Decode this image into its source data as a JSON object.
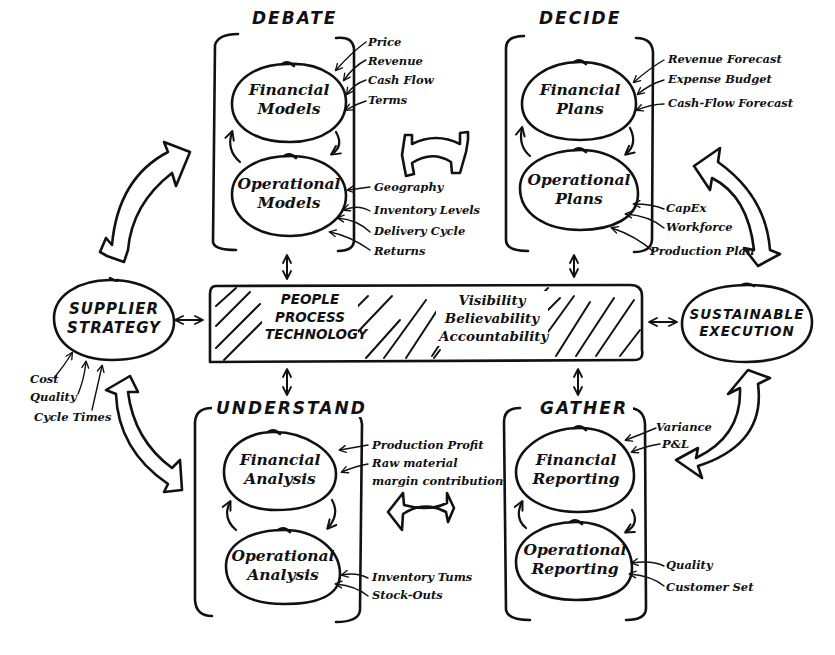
{
  "diagram": {
    "phases": {
      "debate": {
        "title": "DEBATE",
        "top_node": "Financial\nModels",
        "top_node_lines": [
          "Financial",
          "Models"
        ],
        "bottom_node_lines": [
          "Operational",
          "Models"
        ],
        "top_inputs": [
          "Price",
          "Revenue",
          "Cash Flow",
          "Terms"
        ],
        "bottom_inputs": [
          "Geography",
          "Inventory Levels",
          "Delivery Cycle",
          "Returns"
        ]
      },
      "decide": {
        "title": "DECIDE",
        "top_node_lines": [
          "Financial",
          "Plans"
        ],
        "bottom_node_lines": [
          "Operational",
          "Plans"
        ],
        "top_inputs": [
          "Revenue Forecast",
          "Expense Budget",
          "Cash-Flow Forecast"
        ],
        "bottom_inputs": [
          "CapEx",
          "Workforce",
          "Production Plan"
        ]
      },
      "understand": {
        "title": "UNDERSTAND",
        "top_node_lines": [
          "Financial",
          "Analysis"
        ],
        "bottom_node_lines": [
          "Operational",
          "Analysis"
        ],
        "top_inputs": [
          "Production Profit",
          "Raw material",
          "margin contribution"
        ],
        "bottom_inputs": [
          "Inventory Tums",
          "Stock-Outs"
        ]
      },
      "gather": {
        "title": "GATHER",
        "top_node_lines": [
          "Financial",
          "Reporting"
        ],
        "bottom_node_lines": [
          "Operational",
          "Reporting"
        ],
        "top_inputs": [
          "Variance",
          "P&L"
        ],
        "bottom_inputs": [
          "Quality",
          "Customer Set"
        ]
      }
    },
    "supplier_strategy": {
      "lines": [
        "SUPPLIER",
        "STRATEGY"
      ],
      "inputs": [
        "Cost",
        "Quality",
        "Cycle Times"
      ]
    },
    "sustainable_execution": {
      "lines": [
        "SUSTAINABLE",
        "EXECUTION"
      ]
    },
    "center_bar": {
      "left_lines": [
        "PEOPLE",
        "PROCESS",
        "TECHNOLOGY"
      ],
      "right_lines": [
        "Visibility",
        "Believability",
        "Accountability"
      ]
    },
    "colors": {
      "ink": "#111111",
      "background": "#ffffff"
    }
  }
}
